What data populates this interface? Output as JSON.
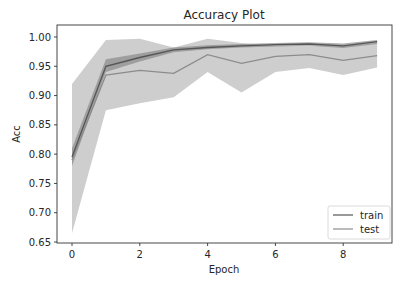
{
  "chart_data": {
    "type": "line",
    "title": "Accuracy Plot",
    "xlabel": "Epoch",
    "ylabel": "Acc",
    "xlim": [
      -0.45,
      9.45
    ],
    "ylim": [
      0.65,
      1.0105
    ],
    "xticks": [
      0,
      2,
      4,
      6,
      8
    ],
    "yticks": [
      0.65,
      0.7,
      0.75,
      0.8,
      0.85,
      0.9,
      0.95,
      1.0
    ],
    "ytick_labels": [
      "0.65",
      "0.70",
      "0.75",
      "0.80",
      "0.85",
      "0.90",
      "0.95",
      "1.00"
    ],
    "grid": false,
    "legend_position": "lower right",
    "x": [
      0,
      1,
      2,
      3,
      4,
      5,
      6,
      7,
      8,
      9
    ],
    "series": [
      {
        "name": "train",
        "color": "#555555",
        "band_color": "#8a8a8a",
        "values": [
          0.795,
          0.95,
          0.965,
          0.978,
          0.982,
          0.985,
          0.987,
          0.988,
          0.985,
          0.992
        ],
        "lower": [
          0.78,
          0.94,
          0.958,
          0.974,
          0.979,
          0.982,
          0.984,
          0.985,
          0.981,
          0.988
        ],
        "upper": [
          0.81,
          0.962,
          0.972,
          0.982,
          0.986,
          0.988,
          0.99,
          0.991,
          0.989,
          0.995
        ]
      },
      {
        "name": "test",
        "color": "#8c8c8c",
        "band_color": "#bdbdbd",
        "values": [
          0.79,
          0.935,
          0.943,
          0.938,
          0.97,
          0.955,
          0.967,
          0.97,
          0.96,
          0.968
        ],
        "lower": [
          0.665,
          0.875,
          0.887,
          0.897,
          0.94,
          0.905,
          0.94,
          0.947,
          0.935,
          0.948
        ],
        "upper": [
          0.92,
          0.995,
          0.997,
          0.982,
          0.997,
          0.99,
          0.985,
          0.985,
          0.985,
          0.99
        ]
      }
    ]
  },
  "legend": {
    "items": [
      {
        "label": "train",
        "color": "#555555"
      },
      {
        "label": "test",
        "color": "#8c8c8c"
      }
    ]
  }
}
